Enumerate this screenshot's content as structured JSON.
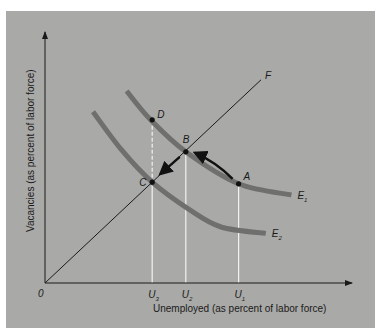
{
  "chart_data": {
    "type": "line",
    "title": "",
    "xlabel": "Unemployed (as percent of labor force)",
    "ylabel": "Vacancies (as percent of labor force)",
    "origin_label": "0",
    "x_ticks": [
      {
        "label": "U",
        "sub": "3",
        "x": 3.35
      },
      {
        "label": "U",
        "sub": "2",
        "x": 4.4
      },
      {
        "label": "U",
        "sub": "1",
        "x": 6.05
      }
    ],
    "xlim": [
      0,
      9.5
    ],
    "ylim": [
      0,
      8
    ],
    "series": [
      {
        "name": "E",
        "sub": "1",
        "kind": "curve",
        "points": [
          [
            2.55,
            6.0
          ],
          [
            3.3,
            5.1
          ],
          [
            4.4,
            4.1
          ],
          [
            6.05,
            3.1
          ],
          [
            7.7,
            2.75
          ]
        ]
      },
      {
        "name": "E",
        "sub": "2",
        "kind": "curve",
        "points": [
          [
            1.5,
            5.35
          ],
          [
            2.4,
            4.15
          ],
          [
            3.35,
            3.15
          ],
          [
            4.5,
            2.3
          ],
          [
            5.5,
            1.75
          ],
          [
            6.9,
            1.55
          ]
        ]
      },
      {
        "name": "F",
        "kind": "line",
        "points": [
          [
            0,
            0
          ],
          [
            6.75,
            6.35
          ]
        ]
      }
    ],
    "points": [
      {
        "label": "D",
        "x": 3.35,
        "y": 5.1
      },
      {
        "label": "B",
        "x": 4.4,
        "y": 4.1
      },
      {
        "label": "C",
        "x": 3.35,
        "y": 3.15
      },
      {
        "label": "A",
        "x": 6.05,
        "y": 3.1
      }
    ],
    "arrows": [
      {
        "from": "A",
        "to": "B",
        "along": "E1"
      },
      {
        "from": "B",
        "to": "C",
        "along": "F"
      }
    ],
    "dashed_guides": [
      {
        "from": "D",
        "to": "C"
      }
    ],
    "grid": false,
    "legend": "none"
  }
}
